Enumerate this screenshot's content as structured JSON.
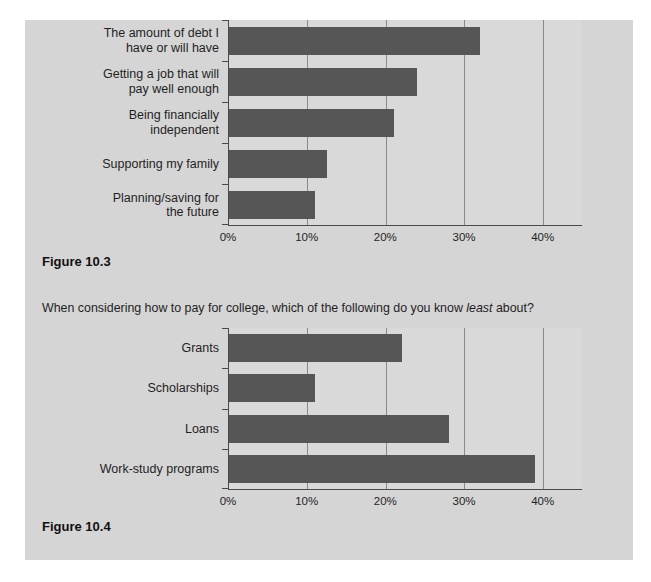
{
  "panel": {
    "background": "#d5d5d5"
  },
  "figures": [
    {
      "caption": "Figure 10.3"
    },
    {
      "caption": "Figure 10.4"
    }
  ],
  "question": {
    "prefix": "When considering how to pay for college, which of the following do you know ",
    "italic": "least",
    "suffix": " about?"
  },
  "chart_data": [
    {
      "type": "bar",
      "orientation": "horizontal",
      "title": "",
      "categories": [
        "The amount of debt I have or will have",
        "Getting a job that will pay well enough",
        "Being financially independent",
        "Supporting my family",
        "Planning/saving for the future"
      ],
      "category_lines": [
        [
          "The amount of debt I",
          "have or will have"
        ],
        [
          "Getting a job that will",
          "pay well enough"
        ],
        [
          "Being financially",
          "independent"
        ],
        [
          "Supporting my family"
        ],
        [
          "Planning/saving for",
          "the future"
        ]
      ],
      "values": [
        32,
        24,
        21,
        12.5,
        11
      ],
      "xlabel": "",
      "ylabel": "",
      "x_ticks": [
        "0%",
        "10%",
        "20%",
        "30%",
        "40%"
      ],
      "x_tick_values": [
        0,
        10,
        20,
        30,
        40
      ],
      "xlim": [
        0,
        45
      ],
      "grid": true,
      "legend": false,
      "bar_color": "#565656"
    },
    {
      "type": "bar",
      "orientation": "horizontal",
      "title": "When considering how to pay for college, which of the following do you know least about?",
      "categories": [
        "Grants",
        "Scholarships",
        "Loans",
        "Work-study programs"
      ],
      "category_lines": [
        [
          "Grants"
        ],
        [
          "Scholarships"
        ],
        [
          "Loans"
        ],
        [
          "Work-study programs"
        ]
      ],
      "values": [
        22,
        11,
        28,
        39
      ],
      "xlabel": "",
      "ylabel": "",
      "x_ticks": [
        "0%",
        "10%",
        "20%",
        "30%",
        "40%"
      ],
      "x_tick_values": [
        0,
        10,
        20,
        30,
        40
      ],
      "xlim": [
        0,
        45
      ],
      "grid": true,
      "legend": false,
      "bar_color": "#565656"
    }
  ]
}
